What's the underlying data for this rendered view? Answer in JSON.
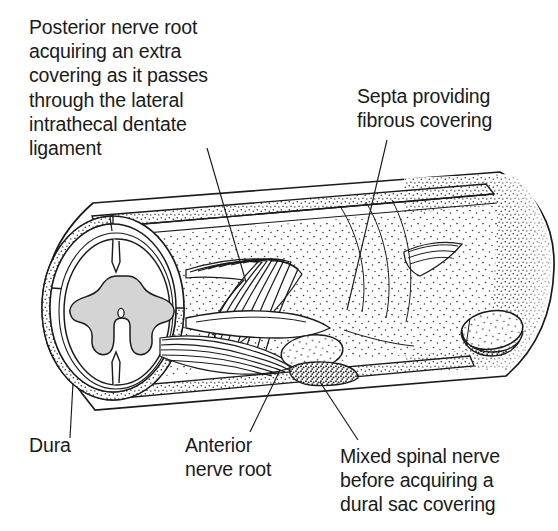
{
  "figure": {
    "background_color": "#ffffff",
    "ink_color": "#1a1a1a",
    "gray_matter_color": "#d4d4d4",
    "width": 558,
    "height": 531
  },
  "labels": {
    "posterior_nerve_root": "Posterior nerve root\nacquiring an extra\ncovering as it passes\nthrough the lateral\nintrathecal dentate\nligament",
    "septa": "Septa providing\nfibrous covering",
    "dura": "Dura",
    "anterior_nerve_root": "Anterior\nnerve root",
    "mixed_spinal_nerve": "Mixed spinal nerve\nbefore acquiring a\ndural sac covering"
  },
  "structures": {
    "dural_sac": "dural-sac-cylinder",
    "spinal_cord": "spinal-cord-cross-section",
    "gray_matter": "gray-matter-butterfly",
    "central_canal": "central-canal",
    "posterior_rootlets": "posterior-nerve-rootlets",
    "anterior_rootlets": "anterior-nerve-rootlets",
    "dorsal_root_ganglion": "dorsal-root-ganglion",
    "mixed_nerve": "mixed-spinal-nerve",
    "distal_ganglion": "distal-root-ganglion",
    "septa": "fibrous-septa"
  },
  "leader_lines": {
    "posterior": "leader-line-posterior",
    "septa": "leader-line-septa",
    "dura": "leader-line-dura",
    "anterior": "leader-line-anterior",
    "mixed": "leader-line-mixed"
  }
}
